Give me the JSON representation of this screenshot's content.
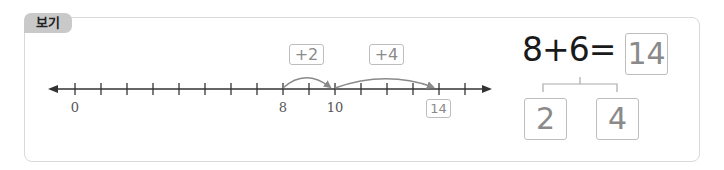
{
  "tab": {
    "label": "보기"
  },
  "number_line": {
    "start": 0,
    "end": 15,
    "labels": [
      {
        "value": 0,
        "text": "0"
      },
      {
        "value": 8,
        "text": "8"
      },
      {
        "value": 10,
        "text": "10"
      }
    ],
    "answer_value": 14,
    "answer_text": "14",
    "jumps": [
      {
        "from": 8,
        "to": 10,
        "label": "+2"
      },
      {
        "from": 10,
        "to": 14,
        "label": "+4"
      }
    ],
    "line_color": "#333333",
    "arc_color": "#8a8a8a"
  },
  "equation": {
    "expression": "8+6=",
    "answer": "14",
    "split": [
      "2",
      "4"
    ]
  }
}
